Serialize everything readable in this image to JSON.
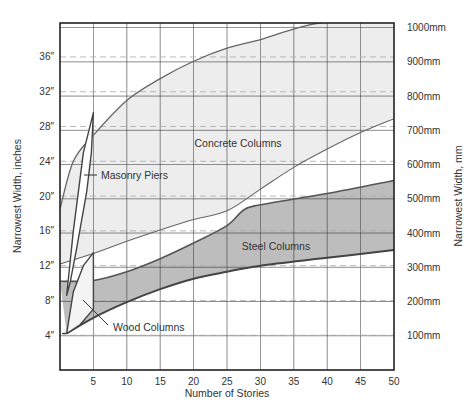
{
  "chart_data": {
    "type": "area",
    "title": "",
    "xlabel": "Number of Stories",
    "ylabel": "Narrowest Width, inches",
    "ylabel_right": "Narrowest Width, mm",
    "xlim": [
      0,
      50
    ],
    "ylim_inches": [
      0,
      40
    ],
    "ylim_mm": [
      0,
      1016
    ],
    "x_ticks": [
      5,
      10,
      15,
      20,
      25,
      30,
      35,
      40,
      45,
      50
    ],
    "x_tick_labels": [
      "5",
      "10",
      "15",
      "20",
      "25",
      "30",
      "35",
      "40",
      "45",
      "50"
    ],
    "y_ticks_inches": [
      4,
      8,
      12,
      16,
      20,
      24,
      28,
      32,
      36
    ],
    "y_tick_labels_inches": [
      "4″",
      "8″",
      "12″",
      "16″",
      "20″",
      "24″",
      "28″",
      "32″",
      "36″"
    ],
    "y_ticks_mm": [
      100,
      200,
      300,
      400,
      500,
      600,
      700,
      800,
      900,
      1000
    ],
    "y_tick_labels_mm": [
      "100mm",
      "200mm",
      "300mm",
      "400mm",
      "500mm",
      "600mm",
      "700mm",
      "800mm",
      "900mm",
      "1000mm"
    ],
    "grid": {
      "major_solid": "mm",
      "minor_dashed": "inches",
      "vertical": "every 5 stories"
    },
    "series": [
      {
        "name": "Concrete Columns",
        "units": "inches",
        "upper": {
          "x": [
            0,
            2,
            5,
            10,
            15,
            20,
            25,
            30,
            35,
            40,
            50
          ],
          "y": [
            18.5,
            24,
            27,
            31,
            33.5,
            35.5,
            37,
            38,
            39.2,
            40,
            40
          ]
        },
        "lower": {
          "x": [
            0,
            5,
            10,
            15,
            20,
            25,
            30,
            35,
            40,
            45,
            50
          ],
          "y": [
            12.2,
            13.4,
            14.8,
            16.1,
            17.3,
            18.3,
            20.8,
            23.3,
            25.4,
            27.3,
            28.9
          ]
        },
        "fill": "#ececec"
      },
      {
        "name": "Steel Columns",
        "units": "inches",
        "upper": {
          "x": [
            0,
            5,
            10,
            15,
            20,
            25,
            27.5,
            30,
            40,
            50
          ],
          "y": [
            10.2,
            10.3,
            11.3,
            12.8,
            14.6,
            16.6,
            18.4,
            19,
            20.3,
            21.8
          ]
        },
        "lower": {
          "x": [
            1,
            5,
            10,
            15,
            20,
            25,
            30,
            40,
            50
          ],
          "y": [
            4.2,
            6,
            7.8,
            9.3,
            10.5,
            11.3,
            12,
            12.9,
            13.8
          ]
        },
        "fill": "#b9b9b9"
      },
      {
        "name": "Masonry Piers",
        "units": "inches",
        "outline": {
          "x": [
            1,
            2,
            3.5,
            5,
            4.7,
            4,
            2.5,
            1.5,
            1
          ],
          "y": [
            8.6,
            16,
            25,
            29.6,
            25,
            20.5,
            14,
            10,
            8.6
          ]
        },
        "fill": "#ffffff"
      },
      {
        "name": "Wood Columns",
        "units": "inches",
        "outline": {
          "x": [
            1,
            2,
            3.5,
            5,
            5,
            3,
            1,
            0.4,
            1
          ],
          "y": [
            4.2,
            9,
            12,
            13.5,
            7,
            5.2,
            4.2,
            4.2,
            4.2
          ]
        },
        "fill": "#f4f4f4"
      }
    ],
    "annotations": [
      {
        "text": "Concrete Columns",
        "x": 26,
        "y": 26
      },
      {
        "text": "Masonry Piers",
        "x": 6,
        "y": 22.5,
        "leader_to": [
          3.5,
          22.5
        ]
      },
      {
        "text": "Steel Columns",
        "x": 33,
        "y": 15
      },
      {
        "text": "Wood Columns",
        "x": 9,
        "y": 5.6,
        "leader_to": [
          3.3,
          9.5
        ]
      }
    ],
    "legend": "none (labels placed inside regions)"
  },
  "labels": {
    "xlabel": "Number of Stories",
    "ylabel_left": "Narrowest Width, inches",
    "ylabel_right": "Narrowest Width, mm",
    "concrete": "Concrete Columns",
    "masonry": "Masonry Piers",
    "steel": "Steel Columns",
    "wood": "Wood Columns"
  }
}
